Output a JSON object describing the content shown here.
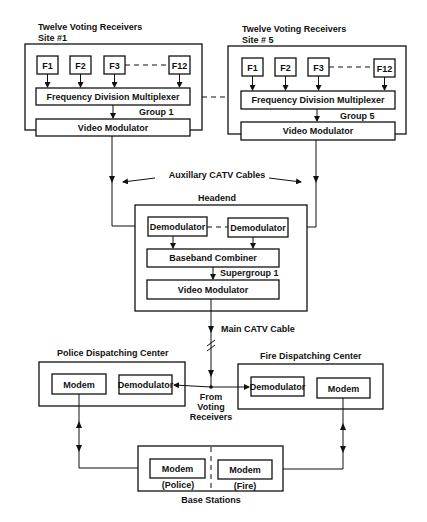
{
  "site1": {
    "title_line1": "Twelve Voting Receivers",
    "title_line2": "Site #1",
    "inputs": [
      "F1",
      "F2",
      "F3",
      "F12"
    ],
    "multiplexer": "Frequency Division Multiplexer",
    "group": "Group 1",
    "modulator": "Video Modulator"
  },
  "site5": {
    "title_line1": "Twelve Voting Receivers",
    "title_line2": "Site # 5",
    "inputs": [
      "F1",
      "F2",
      "F3",
      "F12"
    ],
    "multiplexer": "Frequency Division Multiplexer",
    "group": "Group 5",
    "modulator": "Video Modulator"
  },
  "aux_cables": "Auxillary CATV Cables",
  "headend": {
    "title": "Headend",
    "demod_left": "Demodulator",
    "demod_right": "Demodulator",
    "combiner": "Baseband Combiner",
    "supergroup": "Supergroup 1",
    "modulator": "Video Modulator"
  },
  "main_cable": "Main CATV Cable",
  "police": {
    "title": "Police Dispatching Center",
    "modem": "Modem",
    "demodulator": "Demodulator"
  },
  "fire": {
    "title": "Fire Dispatching Center",
    "demodulator": "Demodulator",
    "modem": "Modem"
  },
  "from_voting": [
    "From",
    "Voting",
    "Receivers"
  ],
  "base_stations": {
    "title": "Base Stations",
    "police_modem": "Modem",
    "police_label": "(Police)",
    "fire_modem": "Modem",
    "fire_label": "(Fire)"
  }
}
